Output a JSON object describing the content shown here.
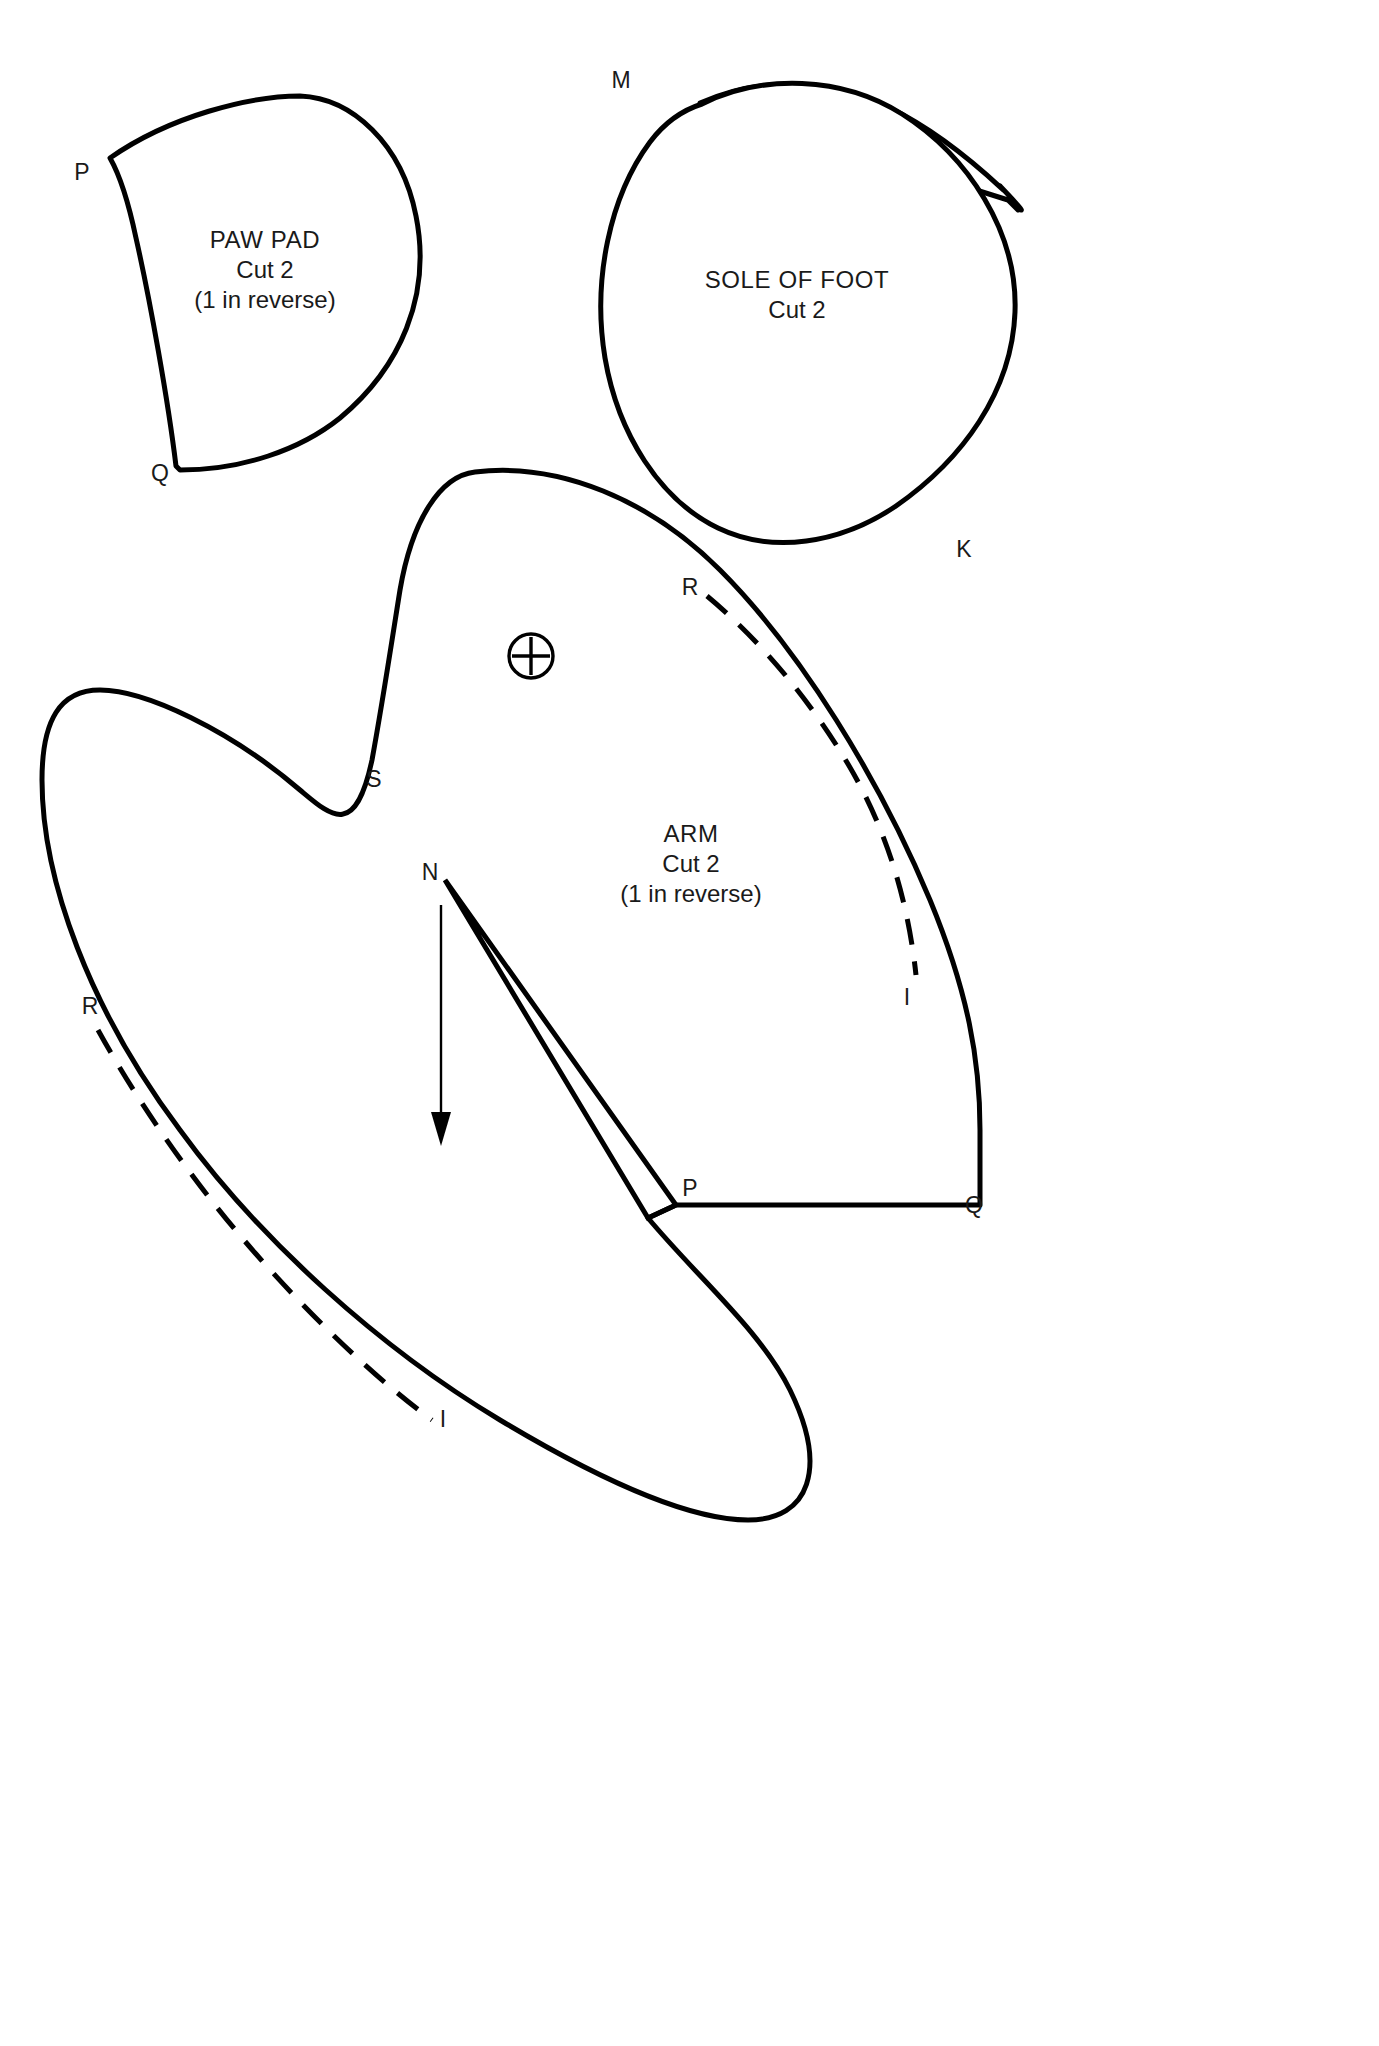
{
  "sheet": {
    "title": "Sewing Pattern Sheet",
    "background_color": "#ffffff",
    "ink_color": "#000000",
    "width": 1379,
    "height": 2046
  },
  "pieces": [
    {
      "id": "paw-pad",
      "name": "PAW PAD",
      "cut": "Cut 2",
      "note": "(1 in reverse)",
      "notches": [
        {
          "label": "P",
          "x": 82,
          "y": 172
        },
        {
          "label": "Q",
          "x": 160,
          "y": 473
        }
      ],
      "label_center": {
        "x": 265,
        "y": 240
      }
    },
    {
      "id": "sole-of-foot",
      "name": "SOLE OF FOOT",
      "cut": "Cut 2",
      "note": "",
      "notches": [
        {
          "label": "M",
          "x": 621,
          "y": 80
        },
        {
          "label": "K",
          "x": 964,
          "y": 549
        }
      ],
      "label_center": {
        "x": 797,
        "y": 280
      }
    },
    {
      "id": "arm",
      "name": "ARM",
      "cut": "Cut 2",
      "note": "(1 in reverse)",
      "notches": [
        {
          "label": "R",
          "x": 690,
          "y": 587
        },
        {
          "label": "S",
          "x": 374,
          "y": 779
        },
        {
          "label": "N",
          "x": 430,
          "y": 872
        },
        {
          "label": "I",
          "x": 907,
          "y": 997
        },
        {
          "label": "R",
          "x": 90,
          "y": 1006
        },
        {
          "label": "P",
          "x": 690,
          "y": 1188
        },
        {
          "label": "Q",
          "x": 974,
          "y": 1205
        },
        {
          "label": "I",
          "x": 443,
          "y": 1419
        }
      ],
      "label_center": {
        "x": 691,
        "y": 834
      },
      "grain_mark": {
        "type": "circle-plus",
        "x": 531,
        "y": 656,
        "r": 22
      },
      "grain_arrow": {
        "x": 441,
        "y": 905,
        "y_end": 1143
      }
    }
  ],
  "legend": {
    "solid_line_meaning": "cutting line",
    "dashed_line_meaning": "stitching / seam line",
    "circle_plus_meaning": "placement mark",
    "arrow_meaning": "grain line direction"
  }
}
